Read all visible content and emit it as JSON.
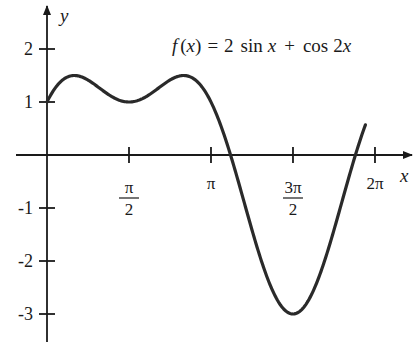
{
  "chart_data": {
    "type": "line",
    "title_parts": {
      "f": "f",
      "open": "(",
      "x": "x",
      "close": ")",
      "eq": "=",
      "two": "2",
      "sin": "sin",
      "x2": "x",
      "plus": "+",
      "cos": "cos",
      "twox": "2",
      "x3": "x"
    },
    "function": "2*sin(x) + cos(2*x)",
    "xlabel": "x",
    "ylabel": "y",
    "xlim": [
      0,
      6.1
    ],
    "ylim": [
      -3.5,
      2.7
    ],
    "x_ticks": [
      {
        "value": 1.5708,
        "label_num": "π",
        "label_den": "2"
      },
      {
        "value": 3.1416,
        "label": "π"
      },
      {
        "value": 4.7124,
        "label_num": "3π",
        "label_den": "2"
      },
      {
        "value": 6.2832,
        "label": "2π"
      }
    ],
    "y_ticks": [
      {
        "value": 2,
        "label": "2"
      },
      {
        "value": 1,
        "label": "1"
      },
      {
        "value": -1,
        "label": "-1"
      },
      {
        "value": -2,
        "label": "-2"
      },
      {
        "value": -3,
        "label": "-3"
      }
    ],
    "series": [
      {
        "name": "f(x)",
        "x": [
          0,
          0.5236,
          1.5708,
          2.618,
          3.1416,
          3.6652,
          4.7124,
          5.7596,
          6.1
        ],
        "values": [
          1,
          1.5,
          1,
          1.5,
          1,
          0.0,
          -3,
          0.0,
          0.57
        ]
      }
    ],
    "key_points": {
      "maxima": [
        [
          0.5236,
          1.5
        ],
        [
          2.618,
          1.5
        ]
      ],
      "local_min": [
        1.5708,
        1
      ],
      "global_min": [
        4.7124,
        -3
      ],
      "y_intercept": [
        0,
        1
      ]
    },
    "grid": false,
    "legend": "none"
  }
}
